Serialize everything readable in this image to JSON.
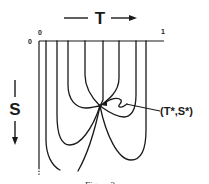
{
  "diagram": {
    "x_axis": {
      "label": "T",
      "direction": "right",
      "ticks": [
        "0",
        "1"
      ]
    },
    "y_axis": {
      "label": "S",
      "direction": "down",
      "origin_label": "0"
    },
    "annotation": {
      "label": "(T*,S*)",
      "point": "convergence point of curves"
    },
    "caption": "Figure 3",
    "curve_count": 7,
    "colors": {
      "ink": "#1a1a1a",
      "background": "#ffffff"
    }
  }
}
